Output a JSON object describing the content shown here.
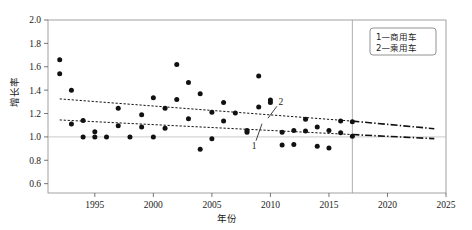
{
  "chart_data": {
    "type": "scatter",
    "title": "",
    "xlabel": "年份",
    "ylabel": "增长率",
    "xlim": [
      1991,
      2025
    ],
    "ylim": [
      0.52,
      2.0
    ],
    "xticks": [
      1995,
      2000,
      2005,
      2010,
      2015,
      2020,
      2025
    ],
    "yticks": [
      0.6,
      0.8,
      1.0,
      1.2,
      1.4,
      1.6,
      1.8,
      2.0
    ],
    "xtick_labels": [
      "1995",
      "2000",
      "2005",
      "2010",
      "2015",
      "2020",
      "2025"
    ],
    "ytick_labels": [
      "0.6",
      "0.8",
      "1.0",
      "1.2",
      "1.4",
      "1.6",
      "1.8",
      "2.0"
    ],
    "grid": "horizontal-at-1.0",
    "reference_line_x": 2017,
    "legend_position": "top-right",
    "legend": [
      {
        "key": "1",
        "dash": "—",
        "label": "商用车"
      },
      {
        "key": "2",
        "dash": "—",
        "label": "乘用车"
      }
    ],
    "curve_labels": [
      {
        "text": "1",
        "series": "commercial-vehicle",
        "x": 2008.6,
        "y": 0.925
      },
      {
        "text": "2",
        "series": "passenger-vehicle",
        "x": 2010.9,
        "y": 1.305
      }
    ],
    "series": [
      {
        "name": "乘用车",
        "key": "2",
        "marker": "filled-circle",
        "points": [
          {
            "x": 1992,
            "y": 1.66
          },
          {
            "x": 1992,
            "y": 1.54
          },
          {
            "x": 1993,
            "y": 1.4
          },
          {
            "x": 1997,
            "y": 1.245
          },
          {
            "x": 1999,
            "y": 1.19
          },
          {
            "x": 2000,
            "y": 1.335
          },
          {
            "x": 2001,
            "y": 1.245
          },
          {
            "x": 2002,
            "y": 1.62
          },
          {
            "x": 2002,
            "y": 1.32
          },
          {
            "x": 2003,
            "y": 1.465
          },
          {
            "x": 2004,
            "y": 1.37
          },
          {
            "x": 2005,
            "y": 1.21
          },
          {
            "x": 2006,
            "y": 1.295
          },
          {
            "x": 2007,
            "y": 1.205
          },
          {
            "x": 2009,
            "y": 1.52
          },
          {
            "x": 2009,
            "y": 1.255
          },
          {
            "x": 2010,
            "y": 1.315
          },
          {
            "x": 2010,
            "y": 1.295
          },
          {
            "x": 2013,
            "y": 1.15
          },
          {
            "x": 2016,
            "y": 1.135
          },
          {
            "x": 2017,
            "y": 1.13
          }
        ]
      },
      {
        "name": "商用车",
        "key": "1",
        "marker": "filled-circle",
        "points": [
          {
            "x": 1993,
            "y": 1.11
          },
          {
            "x": 1994,
            "y": 1.14
          },
          {
            "x": 1994,
            "y": 1.0
          },
          {
            "x": 1995,
            "y": 1.045
          },
          {
            "x": 1995,
            "y": 1.0
          },
          {
            "x": 1996,
            "y": 1.0
          },
          {
            "x": 1997,
            "y": 1.095
          },
          {
            "x": 1998,
            "y": 1.0
          },
          {
            "x": 1999,
            "y": 1.085
          },
          {
            "x": 2000,
            "y": 1.0
          },
          {
            "x": 2001,
            "y": 1.075
          },
          {
            "x": 2003,
            "y": 1.155
          },
          {
            "x": 2004,
            "y": 0.895
          },
          {
            "x": 2005,
            "y": 0.985
          },
          {
            "x": 2006,
            "y": 1.135
          },
          {
            "x": 2008,
            "y": 1.055
          },
          {
            "x": 2008,
            "y": 1.04
          },
          {
            "x": 2011,
            "y": 1.04
          },
          {
            "x": 2011,
            "y": 0.93
          },
          {
            "x": 2012,
            "y": 1.055
          },
          {
            "x": 2012,
            "y": 0.935
          },
          {
            "x": 2013,
            "y": 1.05
          },
          {
            "x": 2014,
            "y": 1.085
          },
          {
            "x": 2014,
            "y": 0.92
          },
          {
            "x": 2015,
            "y": 1.055
          },
          {
            "x": 2015,
            "y": 0.905
          },
          {
            "x": 2016,
            "y": 1.035
          },
          {
            "x": 2017,
            "y": 1.005
          }
        ]
      }
    ],
    "trendlines": [
      {
        "name": "passenger-fit",
        "style": "dashed",
        "x0": 1992,
        "y0": 1.325,
        "x1": 2017,
        "y1": 1.135
      },
      {
        "name": "commercial-fit",
        "style": "dashed",
        "x0": 1992,
        "y0": 1.145,
        "x1": 2017,
        "y1": 1.02
      },
      {
        "name": "passenger-forecast",
        "style": "dash-dot",
        "x0": 2017,
        "y0": 1.135,
        "x1": 2024,
        "y1": 1.07
      },
      {
        "name": "commercial-forecast",
        "style": "dash-dot",
        "x0": 2017,
        "y0": 1.02,
        "x1": 2024,
        "y1": 0.985
      }
    ]
  }
}
